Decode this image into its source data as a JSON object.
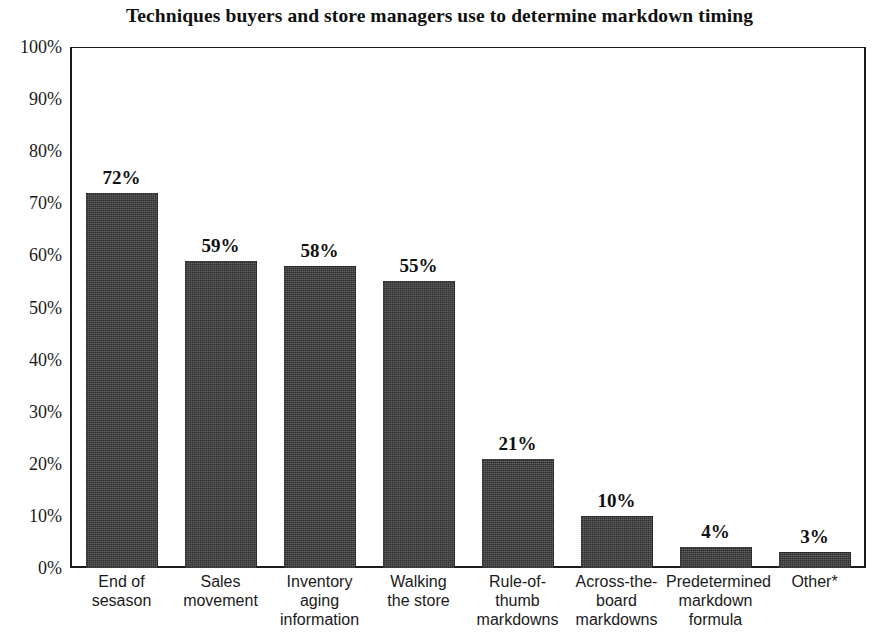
{
  "chart_data": {
    "type": "bar",
    "title": "Techniques buyers and store managers use to determine markdown timing",
    "xlabel": "",
    "ylabel": "",
    "ylim": [
      0,
      100
    ],
    "grid": false,
    "legend": null,
    "categories": [
      "End of sesason",
      "Sales movement",
      "Inventory aging information",
      "Walking the store",
      "Rule-of-thumb markdowns",
      "Across-the-board markdowns",
      "Predetermined markdown formula",
      "Other*"
    ],
    "values": [
      72,
      59,
      58,
      55,
      21,
      10,
      4,
      3
    ],
    "value_labels": [
      "72%",
      "59%",
      "58%",
      "55%",
      "21%",
      "10%",
      "4%",
      "3%"
    ],
    "ytick_labels": [
      "100%",
      "90%",
      "80%",
      "70%",
      "60%",
      "50%",
      "40%",
      "30%",
      "20%",
      "10%",
      "0%"
    ],
    "ytick_values": [
      100,
      90,
      80,
      70,
      60,
      50,
      40,
      30,
      20,
      10,
      0
    ],
    "bar_color": "#3b3b3b",
    "axis_color": "#1c1c1c",
    "background_color": "#ffffff"
  },
  "category_lines": [
    [
      "End of",
      "sesason"
    ],
    [
      "Sales",
      "movement"
    ],
    [
      "Inventory",
      "aging",
      "information"
    ],
    [
      "Walking",
      "the store"
    ],
    [
      "Rule-of-thumb",
      "markdowns"
    ],
    [
      "Across-the-",
      "board",
      "markdowns"
    ],
    [
      "Predetermined",
      "markdown",
      "formula"
    ],
    [
      "Other*"
    ]
  ]
}
